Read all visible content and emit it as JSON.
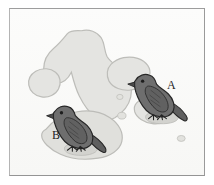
{
  "figure": {
    "kind": "island-map-illustration",
    "frame_border_color": "#a0a0a0",
    "background_color": "#fbfbfa",
    "ocean_color": "#fbfbfa"
  },
  "map": {
    "name": "archipelago-map",
    "island_fill": "#e3e3e0",
    "island_stroke": "#bcbcb8",
    "shadow_fill": "#d6d6d2",
    "islands": [
      {
        "id": "island-large-elongated",
        "name": "large-elongated-island"
      },
      {
        "id": "island-round-west",
        "name": "round-west-island"
      },
      {
        "id": "island-central-blob",
        "name": "central-blob-island"
      },
      {
        "id": "island-southwest-large",
        "name": "southwest-large-island"
      },
      {
        "id": "island-east-small",
        "name": "east-small-island"
      },
      {
        "id": "islet-center-upper",
        "name": "center-upper-islet"
      },
      {
        "id": "islet-center-lower",
        "name": "center-lower-islet"
      },
      {
        "id": "islet-southeast",
        "name": "southeast-islet"
      }
    ]
  },
  "birds": [
    {
      "id": "bird-a",
      "label": "A",
      "body_color": "#6e6e6e",
      "body_shade": "#585858",
      "outline_color": "#2a2a2a",
      "beak": "small-conical",
      "position": "east"
    },
    {
      "id": "bird-b",
      "label": "B",
      "body_color": "#6e6e6e",
      "body_shade": "#585858",
      "outline_color": "#2a2a2a",
      "beak": "small-conical",
      "position": "southwest"
    }
  ],
  "labels": {
    "bird_a": "A",
    "bird_b": "B"
  }
}
